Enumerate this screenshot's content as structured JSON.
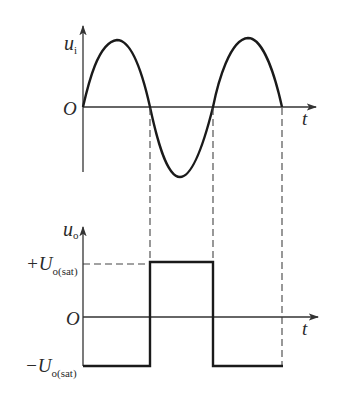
{
  "diagram": {
    "top_plot": {
      "y_label": "u",
      "y_label_sub": "i",
      "origin_label": "O",
      "x_label": "t",
      "signal": "sine",
      "zero_crossings_x": [
        83,
        150,
        213,
        282
      ]
    },
    "bottom_plot": {
      "y_label": "u",
      "y_label_sub": "o",
      "origin_label": "O",
      "x_label": "t",
      "pos_level_prefix": "+U",
      "pos_level_sub": "o(sat)",
      "neg_level_prefix": "−U",
      "neg_level_sub": "o(sat)",
      "signal": "square",
      "segments": [
        {
          "from_x": 83,
          "to_x": 150,
          "level": "-Uo(sat)"
        },
        {
          "from_x": 150,
          "to_x": 213,
          "level": "+Uo(sat)"
        },
        {
          "from_x": 213,
          "to_x": 282,
          "level": "-Uo(sat)"
        }
      ]
    },
    "colors": {
      "stroke": "#1a1a1a",
      "axis": "#333333",
      "dash": "#444444"
    }
  }
}
